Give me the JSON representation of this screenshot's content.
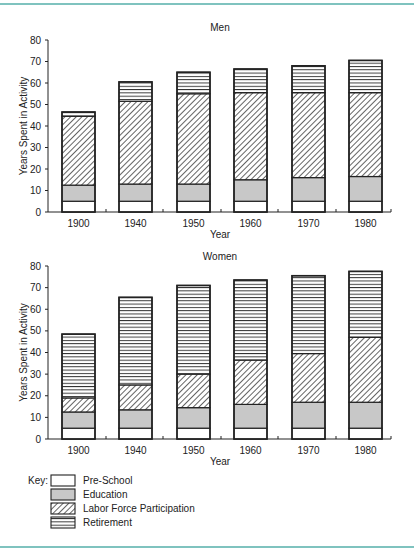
{
  "chart_data": [
    {
      "type": "bar",
      "stacked": true,
      "title": "Men",
      "xlabel": "Year",
      "ylabel": "Years Spent in Activity",
      "ylim": [
        0,
        80
      ],
      "yticks": [
        0,
        10,
        20,
        30,
        40,
        50,
        60,
        70,
        80
      ],
      "categories": [
        "1900",
        "1940",
        "1950",
        "1960",
        "1970",
        "1980"
      ],
      "series": [
        {
          "name": "Pre-School",
          "values": [
            5,
            5,
            5,
            5,
            5,
            5
          ]
        },
        {
          "name": "Education",
          "values": [
            7.5,
            8,
            8,
            10,
            11,
            11.5
          ]
        },
        {
          "name": "Labor Force Participation",
          "values": [
            32,
            38.5,
            42,
            40.5,
            39.5,
            39
          ]
        },
        {
          "name": "Retirement",
          "values": [
            2,
            9,
            10,
            11,
            12.5,
            15
          ]
        }
      ],
      "totals": [
        46.5,
        60.5,
        65,
        66.5,
        68,
        70.5
      ]
    },
    {
      "type": "bar",
      "stacked": true,
      "title": "Women",
      "xlabel": "Year",
      "ylabel": "Years Spent in Activity",
      "ylim": [
        0,
        80
      ],
      "yticks": [
        0,
        10,
        20,
        30,
        40,
        50,
        60,
        70,
        80
      ],
      "categories": [
        "1900",
        "1940",
        "1950",
        "1960",
        "1970",
        "1980"
      ],
      "series": [
        {
          "name": "Pre-School",
          "values": [
            5,
            5,
            5,
            5,
            5,
            5
          ]
        },
        {
          "name": "Education",
          "values": [
            7.5,
            8.5,
            9.5,
            11,
            12,
            12
          ]
        },
        {
          "name": "Labor Force Participation",
          "values": [
            6.5,
            11.5,
            15.5,
            20.5,
            22.5,
            30
          ]
        },
        {
          "name": "Retirement",
          "values": [
            29.5,
            40.5,
            41,
            37,
            36,
            30.5
          ]
        }
      ],
      "totals": [
        48.5,
        65.5,
        71,
        73.5,
        75.5,
        77.5
      ]
    }
  ],
  "legend": {
    "key_label": "Key:",
    "items": [
      {
        "name": "Pre-School",
        "pattern": "white"
      },
      {
        "name": "Education",
        "pattern": "gray"
      },
      {
        "name": "Labor Force Participation",
        "pattern": "diagonal-hatch"
      },
      {
        "name": "Retirement",
        "pattern": "horizontal-lines"
      }
    ]
  },
  "colors": {
    "rule": "#7fc3bf",
    "education_fill": "#c8c8c8",
    "stroke": "#222222"
  }
}
